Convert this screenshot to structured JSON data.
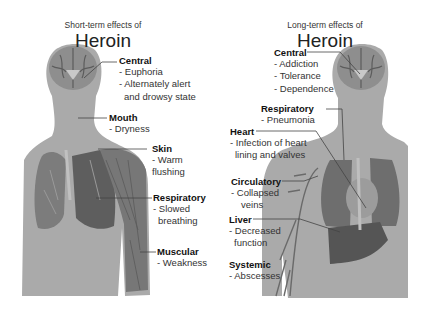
{
  "left": {
    "subtitle": "Short-term effects of",
    "title": "Heroin",
    "sections": [
      {
        "label": "Central",
        "items": [
          "- Euphoria",
          "- Alternately alert",
          "  and drowsy state"
        ]
      },
      {
        "label": "Mouth",
        "items": [
          "- Dryness"
        ]
      },
      {
        "label": "Skin",
        "items": [
          "- Warm",
          "flushing"
        ]
      },
      {
        "label": "Respiratory",
        "items": [
          "- Slowed",
          "breathing"
        ]
      },
      {
        "label": "Muscular",
        "items": [
          "- Weakness"
        ]
      }
    ]
  },
  "right": {
    "subtitle": "Long-term effects of",
    "title": "Heroin",
    "sections": [
      {
        "label": "Central",
        "items": [
          "- Addiction",
          "- Tolerance",
          "- Dependence"
        ]
      },
      {
        "label": "Respiratory",
        "items": [
          "- Pneumonia"
        ]
      },
      {
        "label": "Heart",
        "items": [
          "- Infection of heart",
          "lining and valves"
        ]
      },
      {
        "label": "Circulatory",
        "items": [
          "- Collapsed",
          "veins"
        ]
      },
      {
        "label": "Liver",
        "items": [
          "- Decreased",
          "function"
        ]
      },
      {
        "label": "Systemic",
        "items": [
          "- Abscesses"
        ]
      }
    ]
  },
  "colors": {
    "body": "#a9a9a9",
    "organ_dark": "#5a5a5a",
    "brain": "#8c8c8c",
    "leader": "#444444"
  }
}
